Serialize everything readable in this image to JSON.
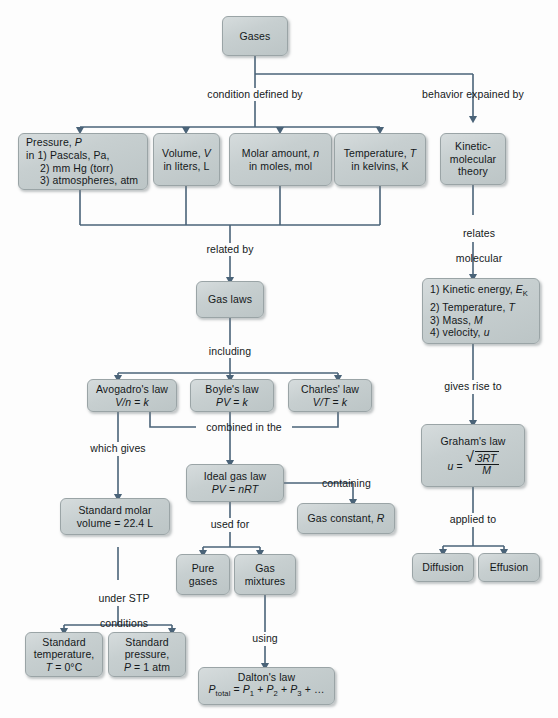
{
  "diagram": {
    "colors": {
      "node_fill": "#c7cfd0",
      "node_border": "#9aa4a6",
      "connector": "#4a6378",
      "text": "#14181a",
      "background": "#fdfdfd"
    },
    "nodes": {
      "gases": "Gases",
      "pressure_l1": "Pressure, P",
      "pressure_l2": "in 1) Pascals, Pa,",
      "pressure_l3": "2) mm Hg (torr)",
      "pressure_l4": "3) atmospheres, atm",
      "volume_l1": "Volume, V",
      "volume_l2": "in liters, L",
      "molar_l1": "Molar amount, n",
      "molar_l2": "in moles, mol",
      "temperature_l1": "Temperature, T",
      "temperature_l2": "in kelvins, K",
      "kmt_l1": "Kinetic-",
      "kmt_l2": "molecular",
      "kmt_l3": "theory",
      "kmt_list_1": "1) Kinetic energy, E",
      "kmt_list_1_sub": "K",
      "kmt_list_2": "2) Temperature, T",
      "kmt_list_3": "3) Mass, M",
      "kmt_list_4": "4) velocity, u",
      "gas_laws": "Gas laws",
      "avogadro_l1": "Avogadro's law",
      "avogadro_l2": "V/n = k",
      "boyle_l1": "Boyle's law",
      "boyle_l2": "PV = k",
      "charles_l1": "Charles' law",
      "charles_l2": "V/T = k",
      "ideal_l1": "Ideal gas law",
      "ideal_l2": "PV = nRT",
      "gas_constant": "Gas constant, R",
      "std_molar_l1": "Standard molar",
      "std_molar_l2": "volume = 22.4 L",
      "std_temp_l1": "Standard",
      "std_temp_l2": "temperature,",
      "std_temp_l3": "T = 0°C",
      "std_press_l1": "Standard",
      "std_press_l2": "pressure,",
      "std_press_l3": "P = 1 atm",
      "pure_l1": "Pure",
      "pure_l2": "gases",
      "mixtures_l1": "Gas",
      "mixtures_l2": "mixtures",
      "dalton_l1": "Dalton's law",
      "dalton_lhs": "P",
      "dalton_lhs_sub": "total",
      "dalton_rhs": " = P",
      "dalton_s1": "1",
      "dalton_p2": " + P",
      "dalton_s2": "2",
      "dalton_p3": " + P",
      "dalton_s3": "3",
      "dalton_tail": " + …",
      "graham_l1": "Graham's law",
      "graham_lhs": "u = ",
      "graham_num": "3RT",
      "graham_den": "M",
      "diffusion": "Diffusion",
      "effusion": "Effusion"
    },
    "edge_labels": {
      "condition_defined_by": "condition defined by",
      "behavior_explained_by": "behavior expained by",
      "related_by": "related by",
      "relates_molecular_l1": "relates",
      "relates_molecular_l2": "molecular",
      "including": "including",
      "combined_in_the": "combined in the",
      "which_gives": "which gives",
      "gives_rise_to": "gives rise to",
      "containing": "containing",
      "used_for": "used for",
      "under_stp_l1": "under STP",
      "under_stp_l2": "conditions",
      "using": "using",
      "applied_to": "applied to"
    }
  }
}
